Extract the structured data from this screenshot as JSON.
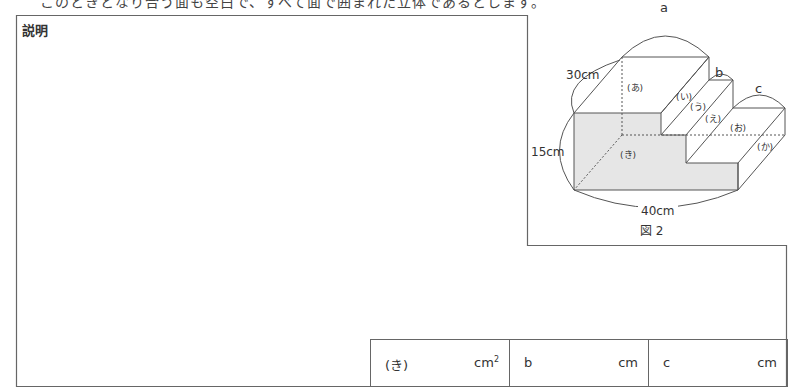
{
  "header": {
    "intro_text": "このときとなり合う面も空白で、すべて面で囲まれた立体であるとします。"
  },
  "explanation_box": {
    "label": "説明"
  },
  "figure": {
    "caption": "図２",
    "labels": {
      "a": "a",
      "b": "b",
      "c": "c",
      "depth": "30cm",
      "height": "15cm",
      "width": "40cm"
    },
    "faces": [
      "(あ)",
      "(い)",
      "(う)",
      "(え)",
      "(お)",
      "(か)",
      "(き)"
    ],
    "shaded_face_color": "#e6e6e6"
  },
  "answers": [
    {
      "label": "(き)",
      "unit": "cm",
      "unit_sup": "2"
    },
    {
      "label": "b",
      "unit": "cm",
      "unit_sup": ""
    },
    {
      "label": "c",
      "unit": "cm",
      "unit_sup": ""
    }
  ]
}
